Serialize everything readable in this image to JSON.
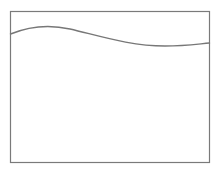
{
  "diagram": {
    "frame": {
      "x": 10.5,
      "y": 11.5,
      "width": 199,
      "height": 151,
      "stroke": "#7a7a7a",
      "stroke_width": 1.2
    },
    "curve": {
      "path": "M10.5,34 C30,26 48,24 70,29 C100,36 130,46 165,46 C185,46 198,44 209.5,43",
      "stroke": "#777777",
      "stroke_width": 1.4
    }
  }
}
